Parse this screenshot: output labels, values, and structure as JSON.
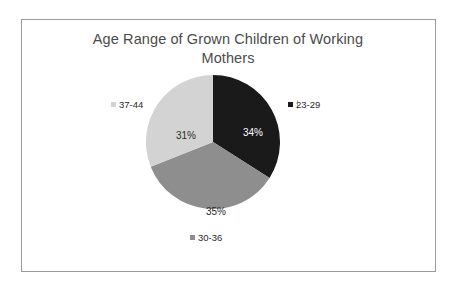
{
  "chart_data": {
    "type": "pie",
    "title": "Age Range of Grown Children of Working Mothers",
    "title_line1": "Age Range of Grown Children of Working",
    "title_line2": "Mothers",
    "categories": [
      "23-29",
      "30-36",
      "37-44"
    ],
    "values": [
      34,
      35,
      31
    ],
    "value_labels": [
      "34%",
      "35%",
      "31%"
    ],
    "unit": "%",
    "start_angle": 0,
    "direction": "clockwise",
    "legend": "data-labels-outside",
    "grid": false,
    "colors": [
      "#1a1a1a",
      "#8e8e8e",
      "#d3d3d3"
    ],
    "slices": [
      {
        "label": "23-29",
        "value": 34,
        "value_label": "34%",
        "color": "#1a1a1a",
        "label_color": "#ffffff"
      },
      {
        "label": "30-36",
        "value": 35,
        "value_label": "35%",
        "color": "#8e8e8e",
        "label_color": "#2b2b2b"
      },
      {
        "label": "37-44",
        "value": 31,
        "value_label": "31%",
        "color": "#d3d3d3",
        "label_color": "#2b2b2b"
      }
    ]
  },
  "style": {
    "border_color": "#9a9a9a",
    "background": "#ffffff",
    "title_color": "#4b4b4b"
  }
}
